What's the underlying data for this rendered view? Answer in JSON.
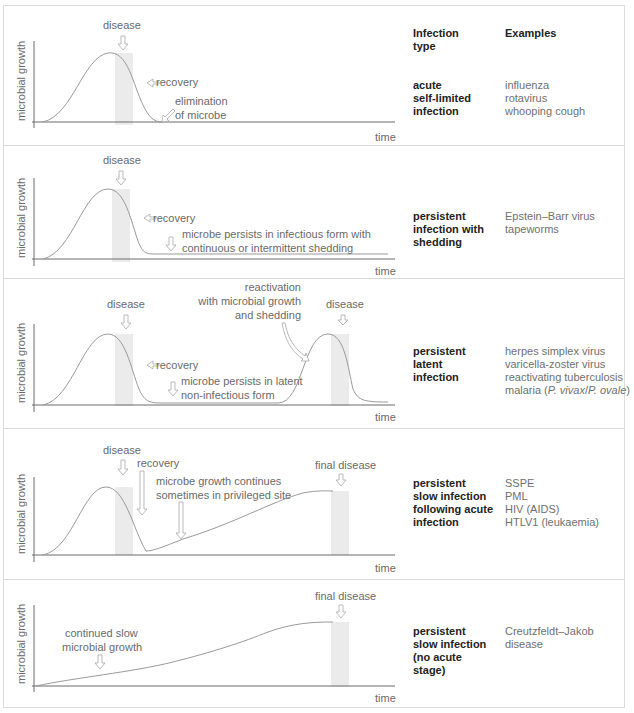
{
  "header": {
    "infection_type_label": "Infection\ntype",
    "examples_label": "Examples"
  },
  "axes": {
    "ylabel": "microbial growth",
    "xlabel": "time"
  },
  "colors": {
    "curve": "#9a9a9a",
    "axis": "#6a6a6a",
    "shade": "#ebebeb",
    "arrow": "#a8a8a8",
    "text": "#6a6a6a",
    "bold_text": "#222222"
  },
  "panels": [
    {
      "type": "acute\nself-limited\ninfection",
      "examples": "influenza\nrotavirus\nwhooping cough",
      "annotations": {
        "disease": "disease",
        "recovery": "recovery",
        "elim1": "elimination",
        "elim2": "of microbe"
      }
    },
    {
      "type": "persistent\ninfection with\nshedding",
      "examples": "Epstein–Barr virus\ntapeworms",
      "annotations": {
        "disease": "disease",
        "recovery": "recovery",
        "persist1": "microbe persists in infectious form with",
        "persist2": "continuous or intermittent shedding"
      }
    },
    {
      "type": "persistent\nlatent\ninfection",
      "examples_lines": [
        "herpes simplex virus",
        "varicella-zoster virus",
        "reactivating tuberculosis",
        "malaria (",
        "P. vivax",
        "/",
        "P. ovale",
        ")"
      ],
      "annotations": {
        "disease": "disease",
        "recovery": "recovery",
        "latent1": "microbe persists in latent",
        "latent2": "non-infectious form",
        "react1": "reactivation",
        "react2": "with microbial growth",
        "react3": "and shedding",
        "disease2": "disease"
      }
    },
    {
      "type": "persistent\nslow infection\nfollowing acute\ninfection",
      "examples": "SSPE\nPML\nHIV (AIDS)\nHTLV1 (leukaemia)",
      "annotations": {
        "disease": "disease",
        "recovery": "recovery",
        "cont1": "microbe growth continues",
        "cont2": "sometimes in privileged site",
        "final": "final disease"
      }
    },
    {
      "type": "persistent\nslow infection\n(no acute\nstage)",
      "examples": "Creutzfeldt–Jakob\ndisease",
      "annotations": {
        "slow1": "continued slow",
        "slow2": "microbial growth",
        "final": "final disease"
      }
    }
  ]
}
